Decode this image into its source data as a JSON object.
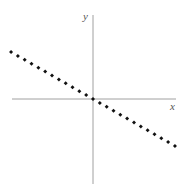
{
  "chart_data": {
    "type": "scatter",
    "title": "",
    "xlabel": "x",
    "ylabel": "y",
    "grid": false,
    "legend": null,
    "axes": {
      "origin_px": [
        93,
        99
      ],
      "x_extent_px": [
        12,
        176
      ],
      "y_extent_px": [
        15,
        184
      ]
    },
    "series": [
      {
        "name": "points",
        "marker": "diamond",
        "color": "#111111",
        "x": [
          -12,
          -11,
          -10,
          -9,
          -8,
          -7,
          -6,
          -5,
          -4,
          -3,
          -2,
          -1,
          0,
          1,
          2,
          3,
          4,
          5,
          6,
          7,
          8,
          9,
          10,
          11,
          12
        ],
        "y": [
          8.4,
          7.7,
          7.0,
          6.3,
          5.6,
          4.9,
          4.2,
          3.5,
          2.8,
          2.1,
          1.4,
          0.7,
          0,
          -0.7,
          -1.4,
          -2.1,
          -2.8,
          -3.5,
          -4.2,
          -4.9,
          -5.6,
          -6.3,
          -7.0,
          -7.7,
          -8.4
        ]
      }
    ]
  },
  "labels": {
    "x_axis": "x",
    "y_axis": "y"
  },
  "colors": {
    "axis": "#888888",
    "points": "#111111"
  }
}
